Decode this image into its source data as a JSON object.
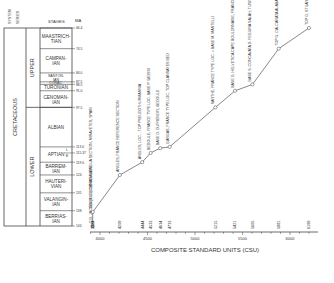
{
  "chart_data": {
    "type": "line",
    "title": "",
    "xlabel": "COMPOSITE STANDARD UNITS (CSU)",
    "ylabel": "MA",
    "xlim": [
      3900,
      6250
    ],
    "ylim": [
      144,
      66.4
    ],
    "x_ticks": [
      4000,
      4500,
      5000,
      5500,
      6000
    ],
    "column_headers": {
      "system": "SYSTEM",
      "series": "SERIES",
      "stages": "STAGES",
      "ma": "MA"
    },
    "system": "CRETACEOUS",
    "series": [
      {
        "name": "UPPER",
        "top": 66.4,
        "bottom": 97.5
      },
      {
        "name": "LOWER",
        "top": 97.5,
        "bottom": 144
      }
    ],
    "stages": [
      {
        "name": "MAASTRICH-TIAN",
        "top": 66.4,
        "bottom": 74.5
      },
      {
        "name": "CAMPAN-IAN",
        "top": 74.5,
        "bottom": 84
      },
      {
        "name": "SANTON-IAN",
        "top": 84,
        "bottom": 87.5
      },
      {
        "name": "CONIAC.",
        "top": 87.5,
        "bottom": 88.5
      },
      {
        "name": "TURONIAN",
        "top": 88.5,
        "bottom": 91
      },
      {
        "name": "CENOMAN-IAN",
        "top": 91,
        "bottom": 97.5
      },
      {
        "name": "ALBIAN",
        "top": 97.5,
        "bottom": 113
      },
      {
        "name": "APTIAN",
        "top": 113,
        "bottom": 119
      },
      {
        "name": "BARREM-IAN",
        "top": 119,
        "bottom": 124
      },
      {
        "name": "HAUTERI-VIAN",
        "top": 124,
        "bottom": 131
      },
      {
        "name": "VALANGIN-IAN",
        "top": 131,
        "bottom": 138
      },
      {
        "name": "BERRIAS-IAN",
        "top": 138,
        "bottom": 144
      }
    ],
    "aptian_substages": [
      "L",
      "E"
    ],
    "ma_ticks": [
      "66.4",
      "74.5",
      "84.0",
      "87.5",
      "88.5",
      "91.0",
      "97.5",
      "113.0",
      "115.37",
      "119.0",
      "124",
      "131",
      "138",
      "144"
    ],
    "series_data": [
      {
        "name": "CSU vs Age",
        "points": [
          {
            "csu": 3922,
            "ma": 144,
            "label": "C.B. JACOBI (3922) CANADA LENGUA SECTION, MIRAVETES, SPAIN"
          },
          {
            "csu": 3924,
            "ma": 138.5,
            "label": "3924 K. LUCIENSIS  SAME"
          },
          {
            "csu": 4209,
            "ma": 124,
            "label": "ANGLES, FRANCE REFERENCE SECTION"
          },
          {
            "csu": 4444,
            "ma": 119,
            "label": "ANGLES, LOC. - TOP PSEUDOTHURMANNIA"
          },
          {
            "csu": 4533,
            "ma": 115.37,
            "label": "BEDOULE, FRANCE  TYPE LOC. BASE P. WEISSI"
          },
          {
            "csu": 4634,
            "ma": 113.5,
            "label": "BASE D. DUFRENOYI, BEDOULE"
          },
          {
            "csu": 4733,
            "ma": 113,
            "label": "GARGAS, FRANCE  TYPE LOC. TOP CLANSAYES BED"
          },
          {
            "csu": 5215,
            "ma": 97.5,
            "label": "SARTHE, FRANCE TYPE LOC. = BASE M. MANTELLI"
          },
          {
            "csu": 5421,
            "ma": 91,
            "label": "BASE G. HELVETICA CAPE BOULONNAISE, FRANCE"
          },
          {
            "csu": 5605,
            "ma": 88.5,
            "label": "BASE S. CONCAVATA D. FEGUIRA SALAH, TUNISIA"
          },
          {
            "csu": 5881,
            "ma": 74.5,
            "label": "TOP G. CALCARATA ALABAMA POWER CO. WELL 3A-3"
          },
          {
            "csu": 6199,
            "ma": 66.4,
            "label": "TOP G. STUARTI EL KEF, TUNISIA"
          }
        ]
      }
    ],
    "point_value_labels": [
      "3922",
      "3924",
      "4209",
      "4444",
      "4533",
      "4634",
      "4733",
      "5215",
      "5421",
      "5605",
      "5881",
      "6199"
    ],
    "grid": false,
    "legend": "none"
  }
}
